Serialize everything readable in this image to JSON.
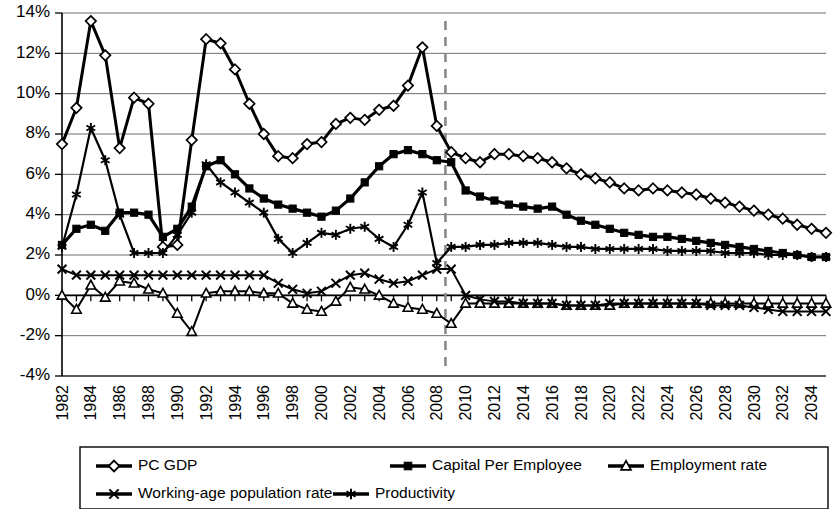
{
  "chart_data": {
    "type": "line",
    "title": "",
    "xlabel": "",
    "ylabel": "",
    "ylim": [
      -4,
      14
    ],
    "ytick_values": [
      14,
      12,
      10,
      8,
      6,
      4,
      2,
      0,
      -2,
      -4
    ],
    "ytick_labels": [
      "14%",
      "12%",
      "10%",
      "8%",
      "6%",
      "4%",
      "2%",
      "0%",
      "-2%",
      "-4%"
    ],
    "grid": true,
    "legend_position": "bottom",
    "x": [
      1982,
      1983,
      1984,
      1985,
      1986,
      1987,
      1988,
      1989,
      1990,
      1991,
      1992,
      1993,
      1994,
      1995,
      1996,
      1997,
      1998,
      1999,
      2000,
      2001,
      2002,
      2003,
      2004,
      2005,
      2006,
      2007,
      2008,
      2009,
      2010,
      2011,
      2012,
      2013,
      2014,
      2015,
      2016,
      2017,
      2018,
      2019,
      2020,
      2021,
      2022,
      2023,
      2024,
      2025,
      2026,
      2027,
      2028,
      2029,
      2030,
      2031,
      2032,
      2033,
      2034,
      2035
    ],
    "xtick_labels": [
      "1982",
      "1984",
      "1986",
      "1988",
      "1990",
      "1992",
      "1994",
      "1996",
      "1998",
      "2000",
      "2002",
      "2004",
      "2006",
      "2008",
      "2010",
      "2012",
      "2014",
      "2016",
      "2018",
      "2020",
      "2022",
      "2024",
      "2026",
      "2028",
      "2030",
      "2032",
      "2034"
    ],
    "xtick_values": [
      1982,
      1984,
      1986,
      1988,
      1990,
      1992,
      1994,
      1996,
      1998,
      2000,
      2002,
      2004,
      2006,
      2008,
      2010,
      2012,
      2014,
      2016,
      2018,
      2020,
      2022,
      2024,
      2026,
      2028,
      2030,
      2032,
      2034
    ],
    "forecast_divider_x": 2008.6,
    "series": [
      {
        "name": "PC GDP",
        "marker": "diamond",
        "values": [
          7.5,
          9.3,
          13.6,
          11.9,
          7.3,
          9.8,
          9.5,
          2.4,
          2.5,
          7.7,
          12.7,
          12.5,
          11.2,
          9.5,
          8.0,
          6.9,
          6.8,
          7.5,
          7.6,
          8.5,
          8.8,
          8.7,
          9.2,
          9.4,
          10.4,
          12.3,
          8.4,
          7.1,
          6.8,
          6.6,
          7.0,
          7.0,
          6.9,
          6.8,
          6.6,
          6.3,
          6.0,
          5.8,
          5.6,
          5.3,
          5.2,
          5.3,
          5.2,
          5.1,
          5.0,
          4.8,
          4.6,
          4.4,
          4.2,
          4.0,
          3.8,
          3.5,
          3.3,
          3.1
        ]
      },
      {
        "name": "Capital Per Employee",
        "marker": "square",
        "values": [
          2.5,
          3.3,
          3.5,
          3.2,
          4.1,
          4.1,
          4.0,
          2.9,
          3.3,
          4.4,
          6.4,
          6.7,
          6.0,
          5.3,
          4.8,
          4.5,
          4.3,
          4.1,
          3.9,
          4.2,
          4.8,
          5.6,
          6.4,
          7.0,
          7.2,
          7.0,
          6.7,
          6.6,
          5.2,
          4.9,
          4.7,
          4.5,
          4.4,
          4.3,
          4.4,
          4.0,
          3.7,
          3.5,
          3.3,
          3.1,
          3.0,
          2.9,
          2.9,
          2.8,
          2.7,
          2.6,
          2.5,
          2.4,
          2.3,
          2.2,
          2.1,
          2.0,
          1.9,
          1.9
        ]
      },
      {
        "name": "Employment rate",
        "marker": "triangle",
        "values": [
          0.0,
          -0.7,
          0.5,
          -0.1,
          0.7,
          0.6,
          0.3,
          0.1,
          -0.9,
          -1.8,
          0.1,
          0.2,
          0.2,
          0.2,
          0.1,
          0.1,
          -0.4,
          -0.7,
          -0.8,
          -0.3,
          0.4,
          0.3,
          0.0,
          -0.4,
          -0.6,
          -0.7,
          -0.9,
          -1.4,
          -0.4,
          -0.4,
          -0.4,
          -0.4,
          -0.4,
          -0.4,
          -0.4,
          -0.5,
          -0.5,
          -0.5,
          -0.5,
          -0.4,
          -0.4,
          -0.4,
          -0.4,
          -0.4,
          -0.4,
          -0.4,
          -0.4,
          -0.4,
          -0.4,
          -0.4,
          -0.4,
          -0.4,
          -0.4,
          -0.4
        ]
      },
      {
        "name": "Working-age population rate",
        "marker": "cross",
        "values": [
          1.3,
          1.0,
          1.0,
          1.0,
          1.0,
          1.0,
          1.0,
          1.0,
          1.0,
          1.0,
          1.0,
          1.0,
          1.0,
          1.0,
          1.0,
          0.6,
          0.3,
          0.1,
          0.2,
          0.6,
          1.0,
          1.1,
          0.8,
          0.6,
          0.7,
          1.0,
          1.3,
          1.3,
          0.0,
          -0.2,
          -0.3,
          -0.3,
          -0.4,
          -0.4,
          -0.4,
          -0.5,
          -0.5,
          -0.5,
          -0.4,
          -0.4,
          -0.4,
          -0.4,
          -0.4,
          -0.4,
          -0.4,
          -0.5,
          -0.5,
          -0.5,
          -0.6,
          -0.7,
          -0.8,
          -0.8,
          -0.8,
          -0.8
        ]
      },
      {
        "name": "Productivity",
        "marker": "star",
        "values": [
          2.4,
          5.0,
          8.3,
          6.7,
          4.0,
          2.1,
          2.1,
          2.1,
          3.0,
          4.1,
          6.5,
          5.6,
          5.1,
          4.6,
          4.1,
          2.8,
          2.1,
          2.6,
          3.1,
          3.0,
          3.3,
          3.4,
          2.8,
          2.4,
          3.5,
          5.1,
          1.6,
          2.4,
          2.4,
          2.5,
          2.5,
          2.6,
          2.6,
          2.6,
          2.5,
          2.4,
          2.4,
          2.3,
          2.3,
          2.3,
          2.3,
          2.3,
          2.2,
          2.2,
          2.2,
          2.2,
          2.1,
          2.1,
          2.1,
          2.0,
          2.0,
          2.0,
          1.9,
          1.9
        ]
      }
    ]
  },
  "legend": {
    "entries": [
      {
        "label": "PC GDP",
        "marker": "diamond"
      },
      {
        "label": "Capital Per Employee",
        "marker": "square"
      },
      {
        "label": "Employment rate",
        "marker": "triangle"
      },
      {
        "label": "Working-age population rate",
        "marker": "cross"
      },
      {
        "label": "Productivity",
        "marker": "star"
      }
    ]
  },
  "colors": {
    "series_line": "#000000",
    "gridline": "#6f6f6f",
    "forecast_divider": "#8a8a8a",
    "background": "#ffffff"
  }
}
